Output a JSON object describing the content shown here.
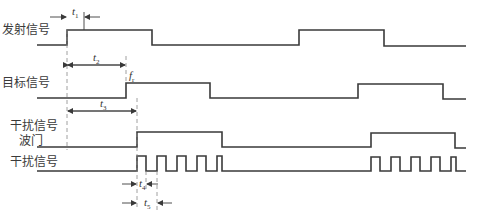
{
  "signals": [
    {
      "id": "transmit",
      "label": "发射信号"
    },
    {
      "id": "target",
      "label": "目标信号"
    },
    {
      "id": "gate",
      "label_line1": "干扰信号",
      "label_line2": "波门"
    },
    {
      "id": "jamming",
      "label": "干扰信号"
    }
  ],
  "annotations": {
    "t1": {
      "main": "t",
      "sub": "1"
    },
    "t2": {
      "main": "t",
      "sub": "2"
    },
    "t3": {
      "main": "t",
      "sub": "3"
    },
    "t4": {
      "main": "t",
      "sub": "4"
    },
    "t5": {
      "main": "t",
      "sub": "5"
    },
    "fr": {
      "main": "f",
      "sub": "r"
    }
  },
  "colors": {
    "line": "#3a3a3a",
    "dash": "#888888",
    "text": "#3a3a3a"
  }
}
